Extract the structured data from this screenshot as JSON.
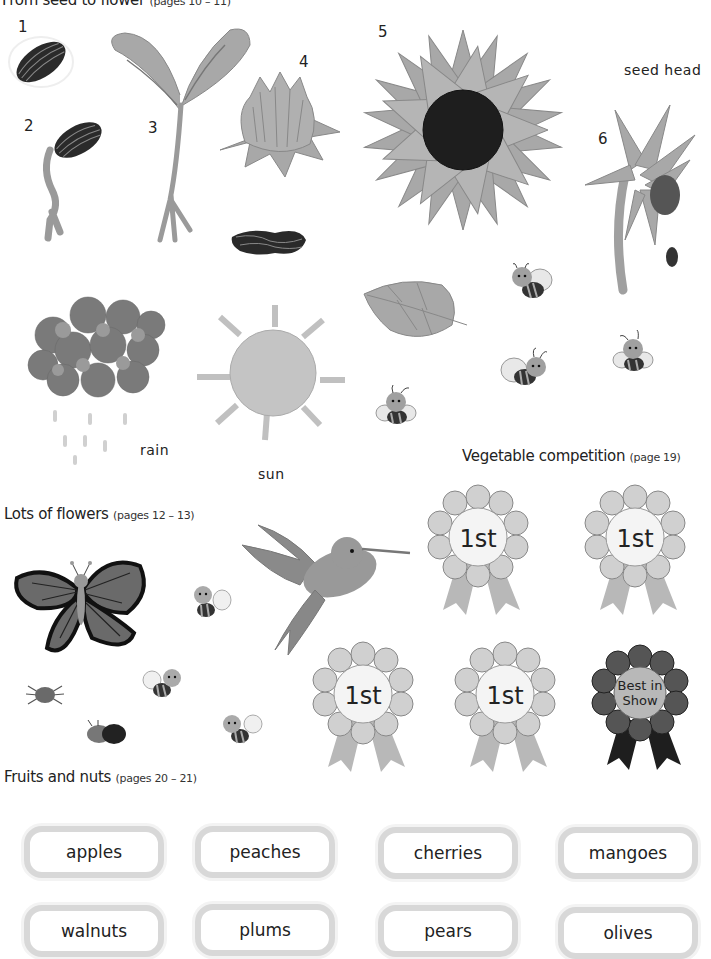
{
  "sections": {
    "seed_to_flower": {
      "title": "From seed to flower",
      "pages": "(pages 10 – 11)"
    },
    "lots_of_flowers": {
      "title": "Lots of flowers",
      "pages": "(pages 12 – 13)"
    },
    "vegetable_competition": {
      "title": "Vegetable competition",
      "pages": "(page 19)"
    },
    "fruits_and_nuts": {
      "title": "Fruits and nuts",
      "pages": "(pages 20 – 21)"
    }
  },
  "growth_stages": [
    {
      "number": "1",
      "item": "seed"
    },
    {
      "number": "2",
      "item": "sprouting seed"
    },
    {
      "number": "3",
      "item": "seedling"
    },
    {
      "number": "4",
      "item": "flower bud"
    },
    {
      "number": "5",
      "item": "sunflower"
    },
    {
      "number": "6",
      "item": "drooping seed head"
    }
  ],
  "labels": {
    "seed_head": "seed head",
    "rain": "rain",
    "sun": "sun"
  },
  "rosettes": [
    {
      "text": "1st",
      "shade": "light"
    },
    {
      "text": "1st",
      "shade": "light"
    },
    {
      "text": "1st",
      "shade": "light"
    },
    {
      "text": "1st",
      "shade": "light"
    },
    {
      "line1": "Best in",
      "line2": "Show",
      "shade": "dark"
    }
  ],
  "fruit_labels": [
    "apples",
    "peaches",
    "cherries",
    "mangoes",
    "walnuts",
    "plums",
    "pears",
    "olives"
  ],
  "colors": {
    "background": "#ffffff",
    "petal": "#a8a8a8",
    "dark_center": "#1e1e1e",
    "pill_border": "#d8d8d8",
    "text": "#222222"
  }
}
